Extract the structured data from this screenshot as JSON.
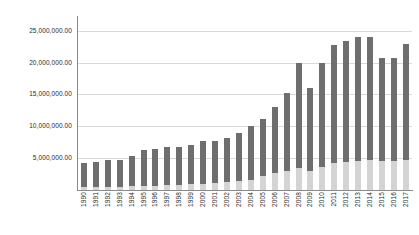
{
  "chart_data": {
    "type": "bar",
    "stacked": true,
    "title": "",
    "subtitle": "",
    "xlabel": "",
    "ylabel": "",
    "ylim": [
      0,
      27000000
    ],
    "grid": true,
    "legend": "none",
    "y_tick_labels": [
      "25,000,000.00",
      "20,000,000.00",
      "15,000,000.00",
      "10,000,000.00",
      "5,000,000.00"
    ],
    "y_ticks": [
      25000000,
      20000000,
      15000000,
      10000000,
      5000000
    ],
    "categories": [
      "1990",
      "1991",
      "1992",
      "1993",
      "1994",
      "1995",
      "1996",
      "1997",
      "1998",
      "1999",
      "2000",
      "2001",
      "2002",
      "2003",
      "2004",
      "2005",
      "2006",
      "2007",
      "2008",
      "2009",
      "2010",
      "2011",
      "2012",
      "2013",
      "2014",
      "2015",
      "2016",
      "2017"
    ],
    "series": [
      {
        "name": "lower-segment",
        "color": "#d4d4d4",
        "values": [
          500000,
          500000,
          550000,
          550000,
          600000,
          700000,
          700000,
          800000,
          800000,
          900000,
          1000000,
          1100000,
          1200000,
          1400000,
          1600000,
          2200000,
          2600000,
          3000000,
          3400000,
          3000000,
          3600000,
          4200000,
          4400000,
          4600000,
          4700000,
          4500000,
          4500000,
          4700000
        ]
      },
      {
        "name": "upper-segment",
        "color": "#6e6e6e",
        "values": [
          3800000,
          3900000,
          4150000,
          4150000,
          4800000,
          5600000,
          5700000,
          6000000,
          5900000,
          6200000,
          6700000,
          6600000,
          6900000,
          7600000,
          8400000,
          9000000,
          10400000,
          12200000,
          16600000,
          13000000,
          16400000,
          18500000,
          19000000,
          19400000,
          19300000,
          16300000,
          16300000,
          18300000
        ]
      }
    ],
    "totals": [
      4300000,
      4400000,
      4700000,
      4700000,
      5400000,
      6300000,
      6400000,
      6800000,
      6700000,
      7100000,
      7700000,
      7700000,
      8100000,
      9000000,
      10000000,
      11200000,
      13000000,
      15200000,
      20000000,
      16000000,
      20000000,
      22700000,
      23400000,
      24000000,
      24000000,
      20800000,
      20800000,
      23000000
    ]
  }
}
